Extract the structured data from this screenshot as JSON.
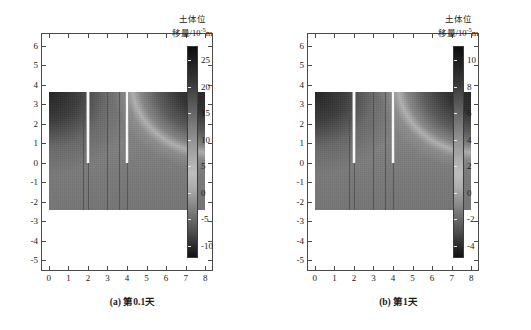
{
  "figure": {
    "panels": [
      {
        "id": "panel-a",
        "caption": "(a) 第0.1天",
        "colorbar": {
          "title_line1": "土体位",
          "title_line2_prefix": "移量/10",
          "title_line2_sup": "-5",
          "title_line2_suffix": "m",
          "ticks": [
            "25",
            "20",
            "15",
            "10",
            "5",
            "0",
            "-5",
            "-10"
          ],
          "vmin": -12.5,
          "vmax": 27.5
        },
        "xaxis": {
          "ticks": [
            "0",
            "1",
            "2",
            "3",
            "4",
            "5",
            "6",
            "7",
            "8"
          ],
          "min": -0.35,
          "max": 8.45
        },
        "yaxis": {
          "ticks": [
            "6",
            "5",
            "4",
            "3",
            "2",
            "1",
            "0",
            "-1",
            "-2",
            "-3",
            "-4",
            "-5"
          ],
          "min": -5.6,
          "max": 6.6
        }
      },
      {
        "id": "panel-b",
        "caption": "(b) 第1天",
        "colorbar": {
          "title_line1": "土体位",
          "title_line2_prefix": "移量/10",
          "title_line2_sup": "-5",
          "title_line2_suffix": "m",
          "ticks": [
            "10",
            "8",
            "6",
            "4",
            "2",
            "0",
            "-2",
            "-4"
          ],
          "vmin": -5.0,
          "vmax": 11.0
        },
        "xaxis": {
          "ticks": [
            "0",
            "1",
            "2",
            "3",
            "4",
            "5",
            "6",
            "7",
            "8"
          ],
          "min": -0.35,
          "max": 8.45
        },
        "yaxis": {
          "ticks": [
            "6",
            "5",
            "4",
            "3",
            "2",
            "1",
            "0",
            "-1",
            "-2",
            "-3",
            "-4",
            "-5"
          ],
          "min": -5.6,
          "max": 6.6
        }
      }
    ]
  },
  "chart_data": {
    "type": "heatmap",
    "title": "",
    "subtitle": "",
    "panels": [
      {
        "label": "(a) 第0.1天",
        "xlabel": "",
        "ylabel": "",
        "xlim": [
          -0.35,
          8.45
        ],
        "ylim": [
          -5.6,
          6.6
        ],
        "xticks": [
          0,
          1,
          2,
          3,
          4,
          5,
          6,
          7,
          8
        ],
        "yticks": [
          6,
          5,
          4,
          3,
          2,
          1,
          0,
          -1,
          -2,
          -3,
          -4,
          -5
        ],
        "grid": false,
        "colorbar_label": "土体位移量/10-5m",
        "colorbar_ticks": [
          25,
          20,
          15,
          10,
          5,
          0,
          -5,
          -10
        ],
        "clim": [
          -12.5,
          27.5
        ],
        "colormap": "gray-diverging-dark-high",
        "data_extent": {
          "x": [
            0.0,
            8.0
          ],
          "y": [
            -2.4,
            3.65
          ]
        },
        "features": [
          {
            "name": "left-high-displacement-lobe",
            "x": [
              0.0,
              1.6
            ],
            "y": [
              1.6,
              3.65
            ],
            "value_approx": 25
          },
          {
            "name": "upper-right-dark-lobe",
            "x": [
              5.0,
              8.0
            ],
            "y": [
              2.0,
              3.65
            ],
            "value_approx": 26
          },
          {
            "name": "bright-arc-band",
            "x": [
              4.4,
              8.0
            ],
            "y": [
              1.8,
              3.4
            ],
            "value_approx": 0
          },
          {
            "name": "background-soil",
            "value_approx": 8
          },
          {
            "name": "lower-zone",
            "x": [
              0.0,
              8.0
            ],
            "y": [
              -2.4,
              0.0
            ],
            "value_approx": 7
          }
        ],
        "slots": [
          {
            "name": "slot-left",
            "x": 2.0,
            "y_top": 3.65,
            "y_bottom": 0.0
          },
          {
            "name": "slot-right",
            "x": 4.0,
            "y_top": 3.65,
            "y_bottom": 0.0
          }
        ],
        "block_boundaries": [
          {
            "name": "boundary-1",
            "x": 1.75
          },
          {
            "name": "boundary-2",
            "x": 3.0
          },
          {
            "name": "boundary-3",
            "x": 3.6
          }
        ]
      },
      {
        "label": "(b) 第1天",
        "xlabel": "",
        "ylabel": "",
        "xlim": [
          -0.35,
          8.45
        ],
        "ylim": [
          -5.6,
          6.6
        ],
        "xticks": [
          0,
          1,
          2,
          3,
          4,
          5,
          6,
          7,
          8
        ],
        "yticks": [
          6,
          5,
          4,
          3,
          2,
          1,
          0,
          -1,
          -2,
          -3,
          -4,
          -5
        ],
        "grid": false,
        "colorbar_label": "土体位移量/10-5m",
        "colorbar_ticks": [
          10,
          8,
          6,
          4,
          2,
          0,
          -2,
          -4
        ],
        "clim": [
          -5.0,
          11.0
        ],
        "colormap": "gray-diverging-dark-high",
        "data_extent": {
          "x": [
            0.0,
            8.0
          ],
          "y": [
            -2.4,
            3.65
          ]
        },
        "features": [
          {
            "name": "left-high-displacement-lobe",
            "x": [
              0.0,
              1.7
            ],
            "y": [
              0.6,
              3.65
            ],
            "value_approx": 10
          },
          {
            "name": "upper-right-dark-lobe",
            "x": [
              4.3,
              8.0
            ],
            "y": [
              1.9,
              3.65
            ],
            "value_approx": 10
          },
          {
            "name": "bright-arc-band",
            "x": [
              4.2,
              8.0
            ],
            "y": [
              1.2,
              3.4
            ],
            "value_approx": 0
          },
          {
            "name": "background-soil",
            "value_approx": 3
          },
          {
            "name": "lower-zone",
            "x": [
              0.0,
              8.0
            ],
            "y": [
              -2.4,
              0.0
            ],
            "value_approx": 2.5
          }
        ],
        "slots": [
          {
            "name": "slot-left",
            "x": 2.0,
            "y_top": 3.65,
            "y_bottom": 0.0
          },
          {
            "name": "slot-right",
            "x": 4.0,
            "y_top": 3.65,
            "y_bottom": 0.0
          }
        ],
        "block_boundaries": [
          {
            "name": "boundary-1",
            "x": 1.75
          },
          {
            "name": "boundary-2",
            "x": 3.0
          },
          {
            "name": "boundary-3",
            "x": 3.6
          }
        ]
      }
    ]
  }
}
